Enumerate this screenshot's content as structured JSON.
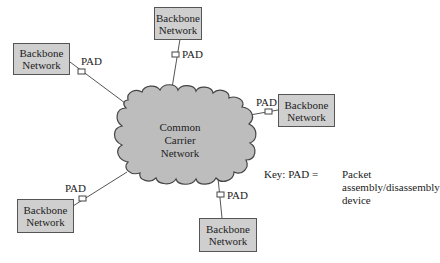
{
  "diagram": {
    "cloud": {
      "lines": [
        "Common",
        "Carrier",
        "Network"
      ],
      "fill": "#bdbdbd",
      "stroke": "#444444"
    },
    "box_fill": "#cfcfcf",
    "pad_label": "PAD",
    "nodes": [
      {
        "id": "top",
        "line1": "Backbone",
        "line2": "Network",
        "pad": "PAD"
      },
      {
        "id": "left",
        "line1": "Backbone",
        "line2": "Network",
        "pad": "PAD"
      },
      {
        "id": "right",
        "line1": "Backbone",
        "line2": "Network",
        "pad": "PAD"
      },
      {
        "id": "bottom-left",
        "line1": "Backbone",
        "line2": "Network",
        "pad": "PAD"
      },
      {
        "id": "bottom",
        "line1": "Backbone",
        "line2": "Network",
        "pad": "PAD"
      }
    ],
    "key": {
      "prefix": "Key: PAD =",
      "line1": "Packet",
      "line2": "assembly/disassembly",
      "line3": "device"
    }
  }
}
